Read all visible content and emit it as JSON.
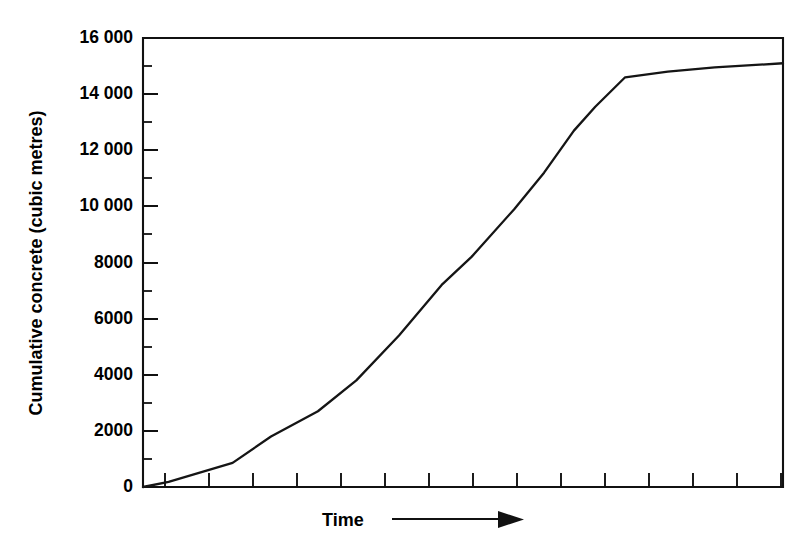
{
  "figure": {
    "background_color": "#ffffff",
    "ink_color": "#111111",
    "curve_color": "#151515"
  },
  "axes": {
    "y_axis_title": "Cumulative concrete (cubic metres)",
    "x_axis_title": "Time",
    "x_axis_arrow_icon": "right-arrow-icon",
    "y_tick_labels": [
      "16 000",
      "14 000",
      "12 000",
      "10 000",
      "8000",
      "6000",
      "4000",
      "2000",
      "0"
    ],
    "y_tick_values": [
      16000,
      14000,
      12000,
      10000,
      8000,
      6000,
      4000,
      2000,
      0
    ],
    "y_minor_tick_values": [
      15000,
      13000,
      11000,
      9000,
      7000,
      5000,
      3000,
      1000
    ],
    "x_tick_count": 15,
    "x_tick_labels": []
  },
  "chart_data": {
    "type": "line",
    "title": "",
    "subtitle": "",
    "xlabel": "Time",
    "ylabel": "Cumulative concrete (cubic metres)",
    "xlim": [
      0,
      15
    ],
    "ylim": [
      0,
      16000
    ],
    "grid": false,
    "legend": false,
    "legend_position": "none",
    "x_axis_tick_labels_shown": false,
    "annotations": [
      "Time → (arrow indicating increasing time)"
    ],
    "series": [
      {
        "name": "Cumulative concrete placed",
        "x": [
          0.0,
          0.6,
          2.1,
          3.0,
          4.1,
          5.0,
          6.0,
          7.0,
          7.7,
          8.7,
          9.4,
          10.1,
          10.6,
          11.3,
          12.3,
          13.4,
          15.0
        ],
        "values": [
          0,
          180,
          860,
          1800,
          2700,
          3800,
          5400,
          7200,
          8200,
          9900,
          11200,
          12700,
          13550,
          14600,
          14800,
          14950,
          15100
        ]
      }
    ]
  }
}
